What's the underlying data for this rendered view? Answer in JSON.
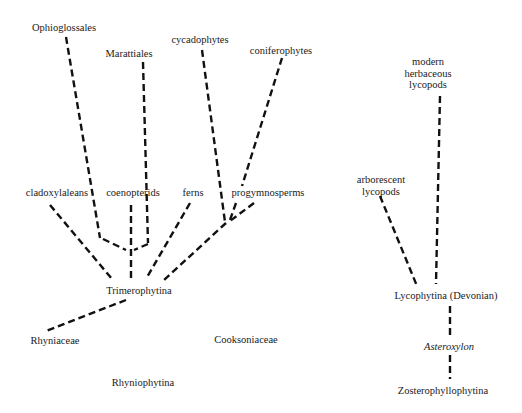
{
  "diagram": {
    "type": "phylogenetic-tree",
    "line_color": "#111111",
    "nodes": {
      "ophioglossales": "Ophioglossales",
      "marattiales": "Marattiales",
      "cycadophytes": "cycadophytes",
      "coniferophytes": "coniferophytes",
      "cladoxylaleans": "cladoxylaleans",
      "coenopterids": "coenopterids",
      "ferns": "ferns",
      "progymnosperms": "progymnosperms",
      "trimerophytina": "Trimerophytina",
      "rhyniaceae": "Rhyniaceae",
      "cooksoniaceae": "Cooksoniaceae",
      "rhyniophytina": "Rhyniophytina",
      "modern_herbaceous_lycopods": [
        "modern",
        "herbaceous",
        "lycopods"
      ],
      "arborescent_lycopods": [
        "arborescent",
        "lycopods"
      ],
      "lycophytina": "Lycophytina (Devonian)",
      "asteroxylon": "Asteroxylon",
      "zosterophyllophytina": "Zosterophyllophytina"
    },
    "edges": [
      {
        "from": "Ophioglossales",
        "to": "coenopterids-junction"
      },
      {
        "from": "Marattiales",
        "to": "coenopterids-junction"
      },
      {
        "from": "coenopterids-junction",
        "to": "Trimerophytina"
      },
      {
        "from": "cladoxylaleans",
        "to": "Trimerophytina"
      },
      {
        "from": "ferns",
        "to": "Trimerophytina"
      },
      {
        "from": "cycadophytes",
        "to": "progymnosperms-junction"
      },
      {
        "from": "coniferophytes",
        "to": "progymnosperms-junction"
      },
      {
        "from": "progymnosperms",
        "to": "progymnosperms-junction"
      },
      {
        "from": "progymnosperms-junction",
        "to": "Trimerophytina"
      },
      {
        "from": "Trimerophytina",
        "to": "Rhyniaceae"
      },
      {
        "from": "modern herbaceous lycopods",
        "to": "Lycophytina (Devonian)"
      },
      {
        "from": "arborescent lycopods",
        "to": "Lycophytina (Devonian)"
      },
      {
        "from": "Lycophytina (Devonian)",
        "to": "Asteroxylon"
      },
      {
        "from": "Asteroxylon",
        "to": "Zosterophyllophytina"
      }
    ]
  }
}
